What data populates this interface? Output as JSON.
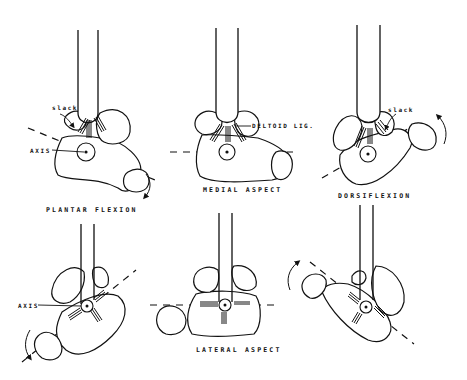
{
  "figure": {
    "panels": [
      {
        "id": "plantar-flexion-medial",
        "caption": "PLANTAR FLEXION",
        "labels": {
          "slack": "slack",
          "axis": "AXIS"
        }
      },
      {
        "id": "neutral-medial",
        "caption": "MEDIAL ASPECT",
        "labels": {
          "ligament": "DELTOID LIG."
        }
      },
      {
        "id": "dorsiflexion-medial",
        "caption": "DORSIFLEXION",
        "labels": {
          "slack": "slack"
        }
      },
      {
        "id": "plantar-flexion-lateral",
        "caption": "",
        "labels": {
          "axis": "AXIS"
        }
      },
      {
        "id": "neutral-lateral",
        "caption": "LATERAL ASPECT",
        "labels": {}
      },
      {
        "id": "dorsiflexion-lateral",
        "caption": "",
        "labels": {}
      }
    ]
  }
}
